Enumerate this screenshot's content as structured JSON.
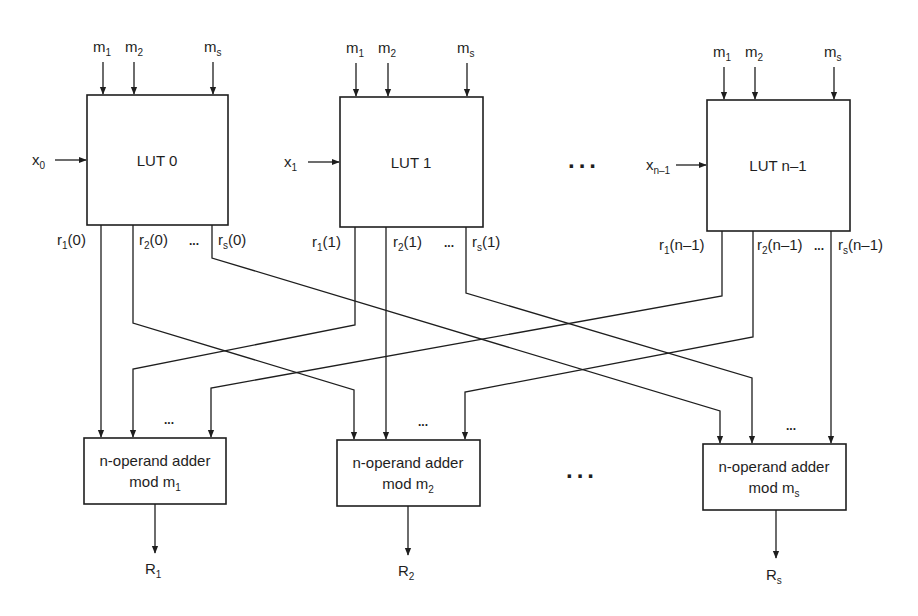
{
  "luts": [
    {
      "label": "LUT 0",
      "input": "x",
      "input_sub": "0",
      "moduli": [
        {
          "b": "m",
          "s": "1"
        },
        {
          "b": "m",
          "s": "2"
        },
        {
          "b": "m",
          "s": "s"
        }
      ],
      "outputs": [
        {
          "b": "r",
          "s": "1",
          "arg": "(0)"
        },
        {
          "b": "r",
          "s": "2",
          "arg": "(0)"
        },
        {
          "b": "r",
          "s": "s",
          "arg": "(0)"
        }
      ]
    },
    {
      "label": "LUT 1",
      "input": "x",
      "input_sub": "1",
      "moduli": [
        {
          "b": "m",
          "s": "1"
        },
        {
          "b": "m",
          "s": "2"
        },
        {
          "b": "m",
          "s": "s"
        }
      ],
      "outputs": [
        {
          "b": "r",
          "s": "1",
          "arg": "(1)"
        },
        {
          "b": "r",
          "s": "2",
          "arg": "(1)"
        },
        {
          "b": "r",
          "s": "s",
          "arg": "(1)"
        }
      ]
    },
    {
      "label": "LUT n–1",
      "input": "x",
      "input_sub": "n–1",
      "moduli": [
        {
          "b": "m",
          "s": "1"
        },
        {
          "b": "m",
          "s": "2"
        },
        {
          "b": "m",
          "s": "s"
        }
      ],
      "outputs": [
        {
          "b": "r",
          "s": "1",
          "arg": "(n–1)"
        },
        {
          "b": "r",
          "s": "2",
          "arg": "(n–1)"
        },
        {
          "b": "r",
          "s": "s",
          "arg": "(n–1)"
        }
      ]
    }
  ],
  "adders": [
    {
      "line1": "n-operand adder",
      "line2": "mod m",
      "line2_sub": "1",
      "result": "R",
      "result_sub": "1"
    },
    {
      "line1": "n-operand adder",
      "line2": "mod m",
      "line2_sub": "2",
      "result": "R",
      "result_sub": "2"
    },
    {
      "line1": "n-operand adder",
      "line2": "mod m",
      "line2_sub": "s",
      "result": "R",
      "result_sub": "s"
    }
  ],
  "ellipsis": "...",
  "small_ellipsis": "...",
  "colors": {
    "stroke": "#1e1e1e",
    "background": "#ffffff"
  }
}
